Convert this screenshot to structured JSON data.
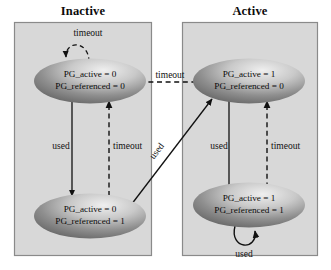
{
  "diagram": {
    "title_left": "Inactive",
    "title_right": "Active",
    "colors": {
      "box_fill": "#d8d8d8",
      "box_border": "#8a8a8a",
      "ellipse_light": "#e8e8e8",
      "ellipse_dark": "#6e6e6e",
      "line": "#111111",
      "text": "#0a0a0a"
    },
    "states": [
      {
        "id": "inactive-unreferenced",
        "line1": "PG_active = 0",
        "line2": "PG_referenced = 0"
      },
      {
        "id": "inactive-referenced",
        "line1": "PG_active = 0",
        "line2": "PG_referenced = 1"
      },
      {
        "id": "active-unreferenced",
        "line1": "PG_active = 1",
        "line2": "PG_referenced = 0"
      },
      {
        "id": "active-referenced",
        "line1": "PG_active = 1",
        "line2": "PG_referenced = 1"
      }
    ],
    "transitions": [
      {
        "id": "inactive-top-selfloop",
        "label": "timeout",
        "style": "dashed"
      },
      {
        "id": "inactive-down-used",
        "label": "used",
        "style": "solid"
      },
      {
        "id": "inactive-up-timeout",
        "label": "timeout",
        "style": "dashed"
      },
      {
        "id": "active-to-inactive-timeout",
        "label": "timeout",
        "style": "dashed"
      },
      {
        "id": "active-down-used",
        "label": "used",
        "style": "solid"
      },
      {
        "id": "active-up-timeout",
        "label": "timeout",
        "style": "dashed"
      },
      {
        "id": "inactive-to-active-used",
        "label": "used",
        "style": "solid"
      },
      {
        "id": "active-bottom-selfloop",
        "label": "used",
        "style": "solid"
      }
    ]
  }
}
